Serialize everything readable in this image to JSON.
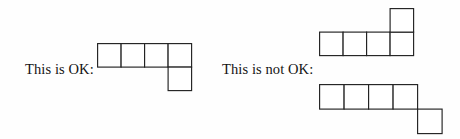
{
  "page": {
    "background_color": "#fefefe",
    "ink_color": "#222222",
    "text_color": "#141414",
    "width": 460,
    "height": 139
  },
  "examples": [
    {
      "id": "ok",
      "label": "This is OK:",
      "verdict": "ok"
    },
    {
      "id": "not-ok",
      "label": "This is not OK:",
      "verdict": "not-ok"
    }
  ],
  "figures": {
    "ok": {
      "name": "ok-polyomino",
      "cell_size": 23.5,
      "cells": [
        {
          "col": 0,
          "row": 0
        },
        {
          "col": 1,
          "row": 0
        },
        {
          "col": 2,
          "row": 0
        },
        {
          "col": 3,
          "row": 0
        },
        {
          "col": 3,
          "row": 1
        }
      ]
    },
    "not_ok_top": {
      "name": "not-ok-polyomino-top",
      "cell_size": 23.5,
      "cells": [
        {
          "col": 0,
          "row": 1
        },
        {
          "col": 1,
          "row": 1
        },
        {
          "col": 2,
          "row": 1
        },
        {
          "col": 3,
          "row": 1
        },
        {
          "col": 3,
          "row": 0
        }
      ]
    },
    "not_ok_bottom": {
      "name": "not-ok-polyomino-bottom",
      "cell_size": 24.5,
      "cells": [
        {
          "col": 0,
          "row": 0
        },
        {
          "col": 1,
          "row": 0
        },
        {
          "col": 2,
          "row": 0
        },
        {
          "col": 3,
          "row": 0
        },
        {
          "col": 4,
          "row": 1
        }
      ]
    }
  }
}
